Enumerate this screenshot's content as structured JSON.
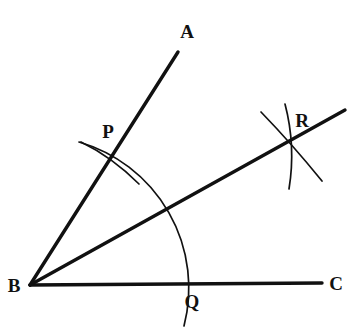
{
  "figure": {
    "background_color": "#ffffff",
    "stroke_color": "#111111",
    "canvas": {
      "width": 358,
      "height": 332
    }
  },
  "points": {
    "B": {
      "label": "B",
      "x": 30,
      "y": 285,
      "label_x": 14,
      "label_y": 285
    },
    "A": {
      "label": "A",
      "x": 178,
      "y": 52,
      "label_x": 187,
      "label_y": 31
    },
    "C": {
      "label": "C",
      "x": 322,
      "y": 283,
      "label_x": 336,
      "label_y": 283
    },
    "P": {
      "label": "P",
      "x": 116,
      "y": 158,
      "label_x": 108,
      "label_y": 131
    },
    "Q": {
      "label": "Q",
      "x": 179,
      "y": 283,
      "label_x": 192,
      "label_y": 301
    },
    "R": {
      "label": "R",
      "x": 290,
      "y": 143,
      "label_x": 302,
      "label_y": 120
    }
  },
  "rays": [
    {
      "name": "ray-ba",
      "from": "B",
      "to": "A",
      "x1": 30,
      "y1": 285,
      "x2": 178,
      "y2": 52
    },
    {
      "name": "ray-bc",
      "from": "B",
      "to": "C",
      "x1": 30,
      "y1": 285,
      "x2": 322,
      "y2": 283
    },
    {
      "name": "ray-bisector",
      "from": "B",
      "to": "R",
      "x1": 30,
      "y1": 285,
      "x2": 345,
      "y2": 110
    }
  ],
  "arcs": [
    {
      "name": "arc-pq",
      "description": "main arc centered at B through P and Q",
      "path": "M 79 142 A 152 152 0 0 1 184 326"
    },
    {
      "name": "arc-at-p",
      "description": "small arc centered at Q crossing ray BA at P",
      "path": "M 81 142 Q 112 157 139 184"
    },
    {
      "name": "arc-at-r-from-p",
      "description": "arc centered at P crossing near R, nearly vertical",
      "path": "M 285 104 Q 296 146 289 189"
    },
    {
      "name": "arc-at-r-from-q",
      "description": "arc centered at Q crossing near R, diagonal",
      "path": "M 261 112 Q 292 144 322 181"
    }
  ],
  "stroke_widths": {
    "ray": 3.4,
    "arc_main": 1.7,
    "arc_small": 1.7
  }
}
